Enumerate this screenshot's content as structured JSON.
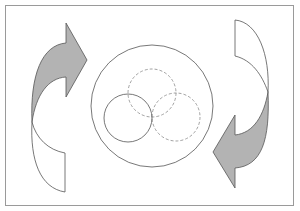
{
  "diagram": {
    "type": "cycle-diagram",
    "frame": {
      "stroke": "#9a9a9a"
    },
    "colors": {
      "arrow_fill": "#b3b3b3",
      "arrow_stroke": "#555555",
      "line": "#555555",
      "dashed": "#8a8a8a",
      "background": "#ffffff"
    },
    "arrows": [
      {
        "name": "left-curved-arrow",
        "direction": "up-right",
        "filled_part": "top"
      },
      {
        "name": "right-curved-arrow",
        "direction": "down-left",
        "filled_part": "bottom"
      }
    ],
    "outer_circle": {
      "style": "solid"
    },
    "inner_circles": [
      {
        "name": "solid-circle",
        "style": "solid",
        "position": "left"
      },
      {
        "name": "dashed-circle-top",
        "style": "dashed",
        "position": "top"
      },
      {
        "name": "dashed-circle-right",
        "style": "dashed",
        "position": "right"
      }
    ]
  }
}
